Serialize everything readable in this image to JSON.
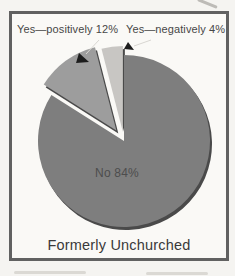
{
  "chart_data": {
    "type": "pie",
    "title": "Formerly Unchurched",
    "direction": "clockwise",
    "start_angle_deg": 0,
    "legend": "none",
    "total": 100,
    "slices": [
      {
        "name": "No",
        "value": 84,
        "label": "No 84%",
        "color": "#7e7e7e",
        "explode_px": 0,
        "label_position": "inside"
      },
      {
        "name": "Yes positively",
        "value": 12,
        "label": "Yes—positively 12%",
        "color": "#9d9d9d",
        "explode_px": 13,
        "label_position": "callout-top-left"
      },
      {
        "name": "Yes negatively",
        "value": 4,
        "label": "Yes—negatively 4%",
        "color": "#c8c6c3",
        "explode_px": 9,
        "label_position": "callout-top-right"
      }
    ],
    "shadow_color": "#4a4a4a",
    "callout_arrow_color": "#1d1d1d",
    "leader_line_color": "#d9d7d2",
    "frame_border_color": "#616161"
  }
}
